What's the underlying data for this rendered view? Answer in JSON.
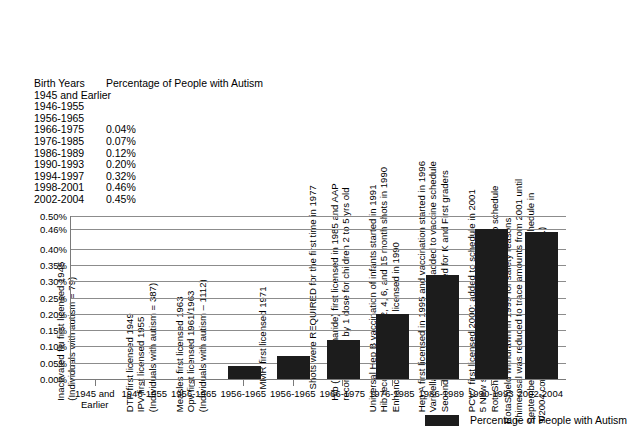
{
  "table": {
    "header": {
      "years": "Birth Years",
      "percentage": "Percentage of People with Autism"
    },
    "rows": [
      {
        "years": "1945 and Earlier",
        "percentage": ""
      },
      {
        "years": "1946-1955",
        "percentage": ""
      },
      {
        "years": "1956-1965",
        "percentage": ""
      },
      {
        "years": "1966-1975",
        "percentage": "0.04%"
      },
      {
        "years": "1976-1985",
        "percentage": "0.07%"
      },
      {
        "years": "1986-1989",
        "percentage": "0.12%"
      },
      {
        "years": "1990-1993",
        "percentage": "0.20%"
      },
      {
        "years": "1994-1997",
        "percentage": "0.32%"
      },
      {
        "years": "1998-2001",
        "percentage": "0.46%"
      },
      {
        "years": "2002-2004",
        "percentage": "0.45%"
      }
    ]
  },
  "legend": {
    "label": "Percentage of People with Autism",
    "color": "#1c1c1c"
  },
  "annotations": [
    {
      "id": "ann-1945",
      "lines": [
        "Inactivated flu first licensed 1945",
        "(Individuals with autism = 79)"
      ]
    },
    {
      "id": "ann-1946-1955",
      "lines": [
        "DTP first licensed 1949",
        "IPV first licensed 1955",
        "(Individuals with autism = 387)"
      ]
    },
    {
      "id": "ann-1956-1965",
      "lines": [
        "Measles first licensed 1963",
        "Opv first licensed 1961/1963",
        "(Individuals with autism – 1112)"
      ]
    },
    {
      "id": "ann-1966-1975",
      "lines": [
        "MMR first licensed 1971"
      ]
    },
    {
      "id": "ann-1976-1985",
      "lines": [
        "Shots were REQUIRED for the first time in 1977"
      ]
    },
    {
      "id": "ann-1986-1989",
      "lines": [
        "Hib (polysaccharide) first licensed in 1985 and AAP",
        "recommended by 1 dose for children 2 to 5 yrs old"
      ]
    },
    {
      "id": "ann-1990-1993",
      "lines": [
        "Universal Hep B vaccination of infants started in 1991",
        "Hib recommended for 2, 4, 6, and 15 month shots in 1990",
        "Enhanced-potency IPV licensed in 1990"
      ]
    },
    {
      "id": "ann-1994-1997",
      "lines": [
        "Hep A first licensed in 1995 and vaccination started in 1996",
        "Varicella first licensed 1995 and added to vaccine schedule",
        "Second Measles vaccine required for K and First graders"
      ]
    },
    {
      "id": "ann-1998-2001",
      "lines": [
        "PCV7 first licensed 2000; added to schedule in 2001",
        "5 New school vaccine REQUIREMENTS",
        "RotaShield first licensed 1998 and added to schedule"
      ]
    },
    {
      "id": "ann-2002-2004",
      "lines": [
        "RotaShield withdrawn in 1999 for safety reasons",
        "Thimerosal was reduced to trace amounts from 2001 until",
        "September 2004 (the flu shot added to the schedule in",
        "9/2004 contains the full amount of thimerosal.)"
      ]
    }
  ],
  "chart_data": {
    "type": "bar",
    "title": "",
    "xlabel": "",
    "ylabel": "",
    "categories": [
      "1945 and\nEarlier",
      "1946-1955",
      "1956-1965",
      "1956-1965",
      "1956-1965",
      "1966-1975",
      "1976-1985",
      "1986-1989",
      "1990-1993",
      "2002-2004"
    ],
    "series": [
      {
        "name": "Percentage of People with Autism",
        "values": [
          0.0,
          0.0,
          0.0,
          0.04,
          0.07,
          0.12,
          0.2,
          0.32,
          0.46,
          0.45
        ]
      }
    ],
    "ytick_labels": [
      "0.50%",
      "0.46%",
      "0.40%",
      "0.35%",
      "0.30%",
      "0.25%",
      "0.20%",
      "0.15%",
      "0.10%",
      "0.05%",
      "0.00%"
    ],
    "ytick_values": [
      0.5,
      0.46,
      0.4,
      0.35,
      0.3,
      0.25,
      0.2,
      0.15,
      0.1,
      0.05,
      0.0
    ],
    "ylim": [
      0.0,
      0.5
    ],
    "grid": true,
    "legend_position": "bottom-right",
    "bar_color": "#1c1c1c"
  }
}
